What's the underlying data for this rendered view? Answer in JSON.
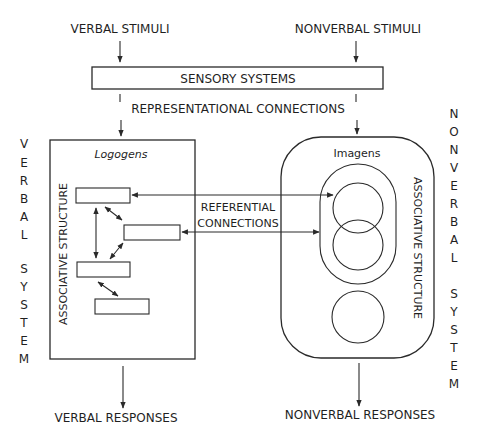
{
  "diagram": {
    "inputs": {
      "verbal_stimuli": "VERBAL STIMULI",
      "nonverbal_stimuli": "NONVERBAL STIMULI"
    },
    "sensory_systems": "SENSORY SYSTEMS",
    "representational_connections": "REPRESENTATIONAL CONNECTIONS",
    "referential_connections": {
      "line1": "REFERENTIAL",
      "line2": "CONNECTIONS"
    },
    "verbal_system": {
      "side_label": "VERBAL SYSTEM",
      "side_letters": [
        "V",
        "E",
        "R",
        "B",
        "A",
        "L",
        "",
        "S",
        "Y",
        "S",
        "T",
        "E",
        "M"
      ],
      "box_title": "Logogens",
      "structure_label": "ASSOCIATIVE STRUCTURE",
      "logogen_count": 4,
      "output": "VERBAL RESPONSES"
    },
    "nonverbal_system": {
      "side_label": "NONVERBAL SYSTEM",
      "side_letters": [
        "N",
        "O",
        "N",
        "V",
        "E",
        "R",
        "B",
        "A",
        "L",
        "",
        "S",
        "Y",
        "S",
        "T",
        "E",
        "M"
      ],
      "box_title": "Imagens",
      "structure_label": "ASSOCIATIVE STRUCTURE",
      "imagen_count": 3,
      "output": "NONVERBAL RESPONSES"
    },
    "colors": {
      "line": "#2a2a2a",
      "text": "#1f1f1f",
      "background": "#ffffff"
    }
  }
}
